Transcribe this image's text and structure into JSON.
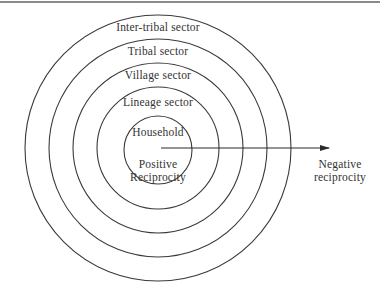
{
  "diagram": {
    "type": "concentric-circles",
    "colors": {
      "stroke": "#3a3a3a",
      "text": "#333333",
      "rule": "#8a8a8a",
      "background": "#ffffff"
    },
    "rings": [
      {
        "label": "Household"
      },
      {
        "label": "Lineage sector"
      },
      {
        "label": "Village sector"
      },
      {
        "label": "Tribal sector"
      },
      {
        "label": "Inter-tribal sector"
      }
    ],
    "center_label_line1": "Positive",
    "center_label_line2": "Reciprocity",
    "arrow": {
      "direction": "outward-right",
      "end_label_line1": "Negative",
      "end_label_line2": "reciprocity"
    }
  }
}
